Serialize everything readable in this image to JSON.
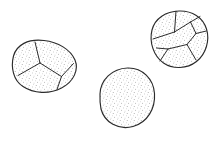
{
  "figure": {
    "title": "Line drawing of three stippled spore-like specimens",
    "background_color": "#ffffff",
    "outline_color": "#2b2b2b",
    "stipple_color": "#8a8a8a",
    "width": 213,
    "height": 152,
    "specimen_count": "3"
  },
  "specimens": [
    {
      "id": "specimen-left-ellipse",
      "label": "Left tilted ellipse, septate, four cells",
      "shape": "ellipse",
      "center_x": 43,
      "center_y": 66,
      "radius_x": 35,
      "radius_y": 22,
      "rotation_deg": -27,
      "cells": "4",
      "septa": "3",
      "outline_path": "M 13.5 56.0 C 16.5 45.0 28.0 38.5 44.0 40.5 C 58.0 42.0 70.5 49.5 75.0 60.0 C 79.0 69.5 74.0 81.5 61.5 88.0 C 49.0 94.5 33.5 93.5 23.0 86.5 C 13.5 80.5 10.5 67.5 13.5 56.0 Z",
      "septa_paths": [
        "M 40.0 63.0 L 35.0 42.0",
        "M 40.0 63.0 L 18.0 75.5",
        "M 40.0 63.0 L 61.5 76.5",
        "M 61.5 76.5 L 57.0 89.5",
        "M 61.5 76.5 L 73.5 63.5"
      ]
    },
    {
      "id": "specimen-right-ovoid",
      "label": "Upper-right ovoid, multicellular, five to six cells",
      "shape": "ovoid",
      "center_x": 178,
      "center_y": 39,
      "radius_x": 30,
      "radius_y": 29,
      "rotation_deg": -22,
      "cells": "6",
      "septa": "6",
      "outline_path": "M 152.0 30.0 C 155.0 18.0 166.0 11.5 179.0 11.0 C 192.0 10.5 203.0 17.5 206.5 29.0 C 210.0 40.5 206.0 54.0 196.5 61.5 C 187.0 69.0 173.0 69.5 163.5 63.0 C 153.5 56.0 149.0 42.0 152.0 30.0 Z",
      "septa_paths": [
        "M 176.0 11.2 L 174.5 32.0",
        "M 174.5 32.0 L 153.0 39.0",
        "M 174.5 32.0 L 190.5 22.0",
        "M 190.5 22.0 L 200.0 16.5",
        "M 190.5 22.0 L 196.0 33.5",
        "M 196.0 33.5 L 206.3 31.0",
        "M 196.0 33.5 L 187.0 44.5",
        "M 187.0 44.5 L 196.0 60.0",
        "M 187.0 44.5 L 168.0 49.0",
        "M 168.0 49.0 L 160.0 61.0",
        "M 168.0 49.0 L 156.5 48.0"
      ]
    },
    {
      "id": "specimen-center-sphere",
      "label": "Lower-center spherical specimen, undivided",
      "shape": "circle",
      "center_x": 127,
      "center_y": 98,
      "radius_x": 28,
      "radius_y": 30,
      "rotation_deg": 0,
      "cells": "1",
      "septa": "0",
      "outline_path": "M 100.0 94.0 C 100.5 80.0 112.0 68.5 127.5 68.0 C 142.5 67.5 153.5 79.0 154.5 93.5 C 155.5 108.5 147.5 122.5 133.0 126.5 C 118.5 130.5 104.5 122.5 101.0 109.0 C 100.0 104.0 99.8 99.0 100.0 94.0 Z",
      "septa_paths": []
    }
  ]
}
